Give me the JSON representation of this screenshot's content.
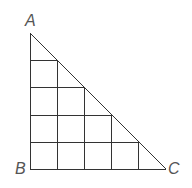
{
  "diagram": {
    "type": "right-triangle-grid",
    "grid_size": 5,
    "line_color": "#333333",
    "label_color": "#555555",
    "vertices": {
      "A": {
        "label": "A",
        "position": "top"
      },
      "B": {
        "label": "B",
        "position": "bottom-left",
        "right_angle": true
      },
      "C": {
        "label": "C",
        "position": "bottom-right"
      }
    }
  }
}
